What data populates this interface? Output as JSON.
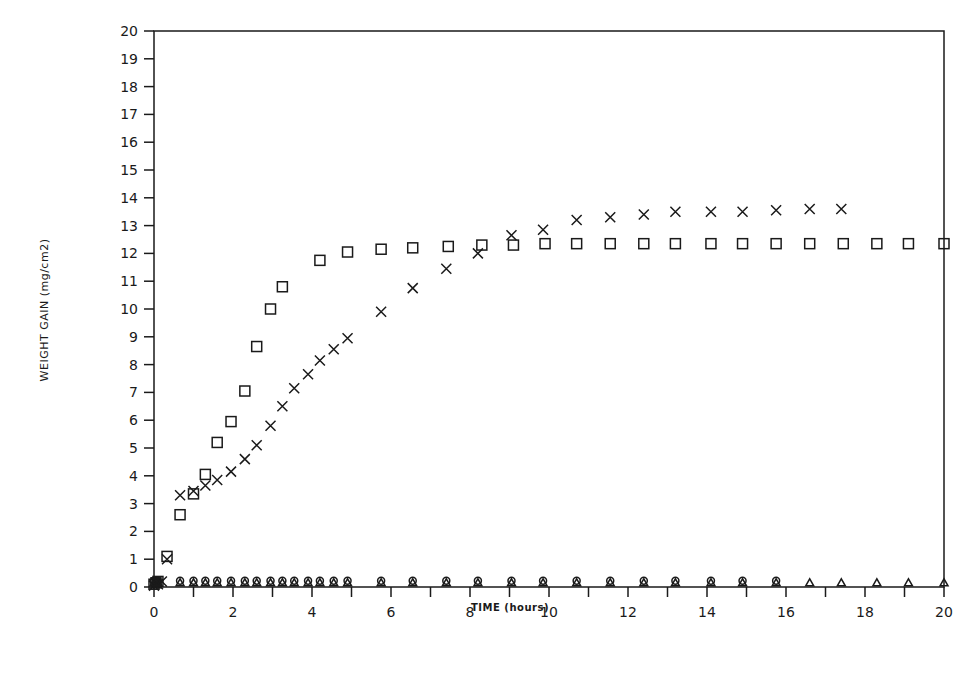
{
  "chart_data": {
    "type": "scatter",
    "title": "",
    "xlabel": "TIME (hours)",
    "ylabel": "WEIGHT GAIN (mg/cm2)",
    "xlim": [
      0,
      20
    ],
    "ylim": [
      0,
      20
    ],
    "x_ticks": [
      0,
      2,
      4,
      6,
      8,
      10,
      12,
      14,
      16,
      18,
      20
    ],
    "x_minor_ticks": [
      1,
      3,
      5,
      7,
      9,
      11,
      13,
      15,
      17,
      19
    ],
    "y_ticks": [
      0,
      1,
      2,
      3,
      4,
      5,
      6,
      7,
      8,
      9,
      10,
      11,
      12,
      13,
      14,
      15,
      16,
      17,
      18,
      19,
      20
    ],
    "grid": false,
    "legend": null,
    "series": [
      {
        "name": "square",
        "marker": "square",
        "x": [
          0,
          0.05,
          0.1,
          0.33,
          0.66,
          1.0,
          1.3,
          1.6,
          1.95,
          2.3,
          2.6,
          2.95,
          3.25,
          4.2,
          4.9,
          5.75,
          6.55,
          7.45,
          8.3,
          9.1,
          9.9,
          10.7,
          11.55,
          12.4,
          13.2,
          14.1,
          14.9,
          15.75,
          16.6,
          17.45,
          18.3,
          19.1,
          20.0
        ],
        "y": [
          0.1,
          0.15,
          0.2,
          1.1,
          2.6,
          3.35,
          4.05,
          5.2,
          5.95,
          7.05,
          8.65,
          10.0,
          10.8,
          11.75,
          12.05,
          12.15,
          12.2,
          12.25,
          12.3,
          12.3,
          12.35,
          12.35,
          12.35,
          12.35,
          12.35,
          12.35,
          12.35,
          12.35,
          12.35,
          12.35,
          12.35,
          12.35,
          12.35
        ]
      },
      {
        "name": "cross",
        "marker": "x",
        "x": [
          0,
          0.05,
          0.1,
          0.2,
          0.33,
          0.66,
          1.0,
          1.3,
          1.6,
          1.95,
          2.3,
          2.6,
          2.95,
          3.25,
          3.55,
          3.9,
          4.2,
          4.55,
          4.9,
          5.75,
          6.55,
          7.4,
          8.2,
          9.05,
          9.85,
          10.7,
          11.55,
          12.4,
          13.2,
          14.1,
          14.9,
          15.75,
          16.6,
          17.4
        ],
        "y": [
          0.05,
          0.15,
          0.1,
          0.2,
          1.0,
          3.3,
          3.45,
          3.65,
          3.85,
          4.15,
          4.6,
          5.1,
          5.8,
          6.5,
          7.15,
          7.65,
          8.15,
          8.55,
          8.95,
          9.9,
          10.75,
          11.45,
          12.0,
          12.65,
          12.85,
          13.2,
          13.3,
          13.4,
          13.5,
          13.5,
          13.5,
          13.55,
          13.6,
          13.6
        ]
      },
      {
        "name": "circle",
        "marker": "circle",
        "x": [
          0,
          0.05,
          0.1,
          0.66,
          1.0,
          1.3,
          1.6,
          1.95,
          2.3,
          2.6,
          2.95,
          3.25,
          3.55,
          3.9,
          4.2,
          4.55,
          4.9,
          5.75,
          6.55,
          7.4,
          8.2,
          9.05,
          9.85,
          10.7,
          11.55,
          12.4,
          13.2,
          14.1,
          14.9,
          15.75
        ],
        "y": [
          0.1,
          0.1,
          0.1,
          0.12,
          0.12,
          0.12,
          0.12,
          0.12,
          0.12,
          0.12,
          0.12,
          0.12,
          0.12,
          0.12,
          0.12,
          0.12,
          0.12,
          0.12,
          0.12,
          0.12,
          0.12,
          0.12,
          0.12,
          0.12,
          0.12,
          0.12,
          0.12,
          0.12,
          0.12,
          0.12
        ]
      },
      {
        "name": "triangle",
        "marker": "triangle",
        "x": [
          0,
          0.05,
          0.1,
          0.66,
          1.0,
          1.3,
          1.6,
          1.95,
          2.3,
          2.6,
          2.95,
          3.25,
          3.55,
          3.9,
          4.2,
          4.55,
          4.9,
          5.75,
          6.55,
          7.4,
          8.2,
          9.05,
          9.85,
          10.7,
          11.55,
          12.4,
          13.2,
          14.1,
          14.9,
          15.75,
          16.6,
          17.4,
          18.3,
          19.1,
          20.0
        ],
        "y": [
          0.08,
          0.08,
          0.08,
          0.08,
          0.08,
          0.08,
          0.08,
          0.08,
          0.08,
          0.08,
          0.08,
          0.08,
          0.08,
          0.08,
          0.08,
          0.08,
          0.08,
          0.08,
          0.08,
          0.08,
          0.08,
          0.08,
          0.08,
          0.08,
          0.08,
          0.08,
          0.08,
          0.08,
          0.08,
          0.08,
          0.08,
          0.08,
          0.08,
          0.08,
          0.08
        ]
      }
    ]
  },
  "style": {
    "ink": "#1a1a1a",
    "background": "#ffffff"
  }
}
